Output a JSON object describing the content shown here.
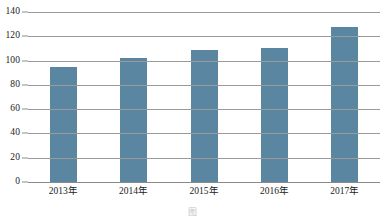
{
  "chart_data": {
    "type": "bar",
    "title": "",
    "subtitle": "",
    "xlabel": "",
    "ylabel": "",
    "categories": [
      "2013年",
      "2014年",
      "2015年",
      "2016年",
      "2017年"
    ],
    "values": [
      95,
      102,
      109,
      110,
      128
    ],
    "series": [
      {
        "name": "",
        "values": [
          95,
          102,
          109,
          110,
          128
        ]
      }
    ],
    "ylim": [
      0,
      140
    ],
    "yticks": [
      0,
      20,
      40,
      60,
      80,
      100,
      120,
      140
    ],
    "ytick_labels": [
      "0",
      "20",
      "40",
      "60",
      "80",
      "100",
      "120",
      "140"
    ],
    "grid": true,
    "grid_axis": "y",
    "legend": false,
    "legend_position": "none",
    "annotations": [],
    "bar_color": "#5b86a2",
    "grid_color": "#9a9a9a",
    "axis_color": "#8a8a8a",
    "background_color": "#ffffff"
  },
  "caption": {
    "text": "图"
  }
}
